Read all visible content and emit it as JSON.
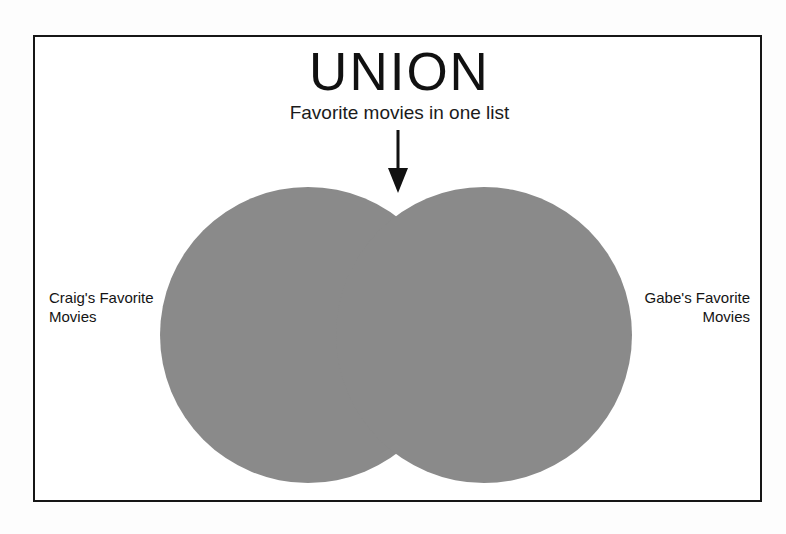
{
  "diagram": {
    "title": "UNION",
    "subtitle": "Favorite movies in one list",
    "type": "venn-union",
    "frame_color": "#161616",
    "background_color": "#ffffff",
    "fill_color": "#8a8a8a",
    "arrow": {
      "icon": "down-arrow-icon",
      "points_to": "union-region",
      "color": "#111111"
    },
    "sets": [
      {
        "id": "left-set",
        "label_line_1": "Craig's Favorite",
        "label_line_2": "Movies",
        "align": "left",
        "filled": true
      },
      {
        "id": "right-set",
        "label_line_1": "Gabe's Favorite",
        "label_line_2": "Movies",
        "align": "right",
        "filled": true
      }
    ],
    "highlighted_region": "both-circles-entirely"
  }
}
